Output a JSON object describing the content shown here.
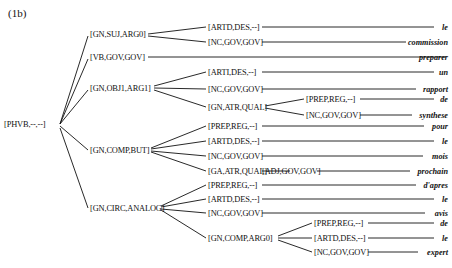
{
  "figure": {
    "caption": "(1b)",
    "sentence_words": [
      "le",
      "commission",
      "preparer",
      "un",
      "rapport",
      "de",
      "synthese",
      "pour",
      "le",
      "mois",
      "prochain",
      "d'apres",
      "le",
      "avis",
      "de",
      "le",
      "expert"
    ]
  },
  "tree": {
    "root": {
      "label": "[PHVB,--,--]",
      "x": 4,
      "y": 124
    },
    "level2": [
      {
        "label": "[GN,SUJ,ARG0]",
        "x": 90,
        "y": 34
      },
      {
        "label": "[VB,GOV,GOV]",
        "x": 90,
        "y": 57
      },
      {
        "label": "[GN,OBJ1,ARG1]",
        "x": 90,
        "y": 88
      },
      {
        "label": "[GN,COMP,BUT]",
        "x": 90,
        "y": 150
      },
      {
        "label": "[GN,CIRC,ANALOG]",
        "x": 90,
        "y": 208
      }
    ],
    "level3": [
      {
        "label": "[ARTD,DES,--]",
        "x": 208,
        "y": 27,
        "parent": 0
      },
      {
        "label": "[NC,GOV,GOV]",
        "x": 208,
        "y": 42,
        "parent": 0
      },
      {
        "label": "[ARTI,DES,--]",
        "x": 208,
        "y": 72,
        "parent": 2
      },
      {
        "label": "[NC,GOV,GOV]",
        "x": 208,
        "y": 89,
        "parent": 2
      },
      {
        "label": "[GN,ATR,QUAL]",
        "x": 208,
        "y": 107,
        "parent": 2
      },
      {
        "label": "[PREP,REG,--]",
        "x": 208,
        "y": 126,
        "parent": 3
      },
      {
        "label": "[ARTD,DES,--]",
        "x": 208,
        "y": 141,
        "parent": 3
      },
      {
        "label": "[NC,GOV,GOV]",
        "x": 208,
        "y": 156,
        "parent": 3
      },
      {
        "label": "[GA,ATR,QUAL]",
        "x": 208,
        "y": 171,
        "parent": 3
      },
      {
        "label": "[PREP,REG,--]",
        "x": 208,
        "y": 185,
        "parent": 4
      },
      {
        "label": "[ARTD,DES,--]",
        "x": 208,
        "y": 199,
        "parent": 4
      },
      {
        "label": "[NC,GOV,GOV]",
        "x": 208,
        "y": 213,
        "parent": 4
      },
      {
        "label": "[GN,COMP,ARG0]",
        "x": 208,
        "y": 238,
        "parent": 4
      }
    ],
    "level4": [
      {
        "label": "[PREP,REG,--]",
        "x": 306,
        "y": 99,
        "parent": 4
      },
      {
        "label": "[NC,GOV,GOV]",
        "x": 306,
        "y": 115,
        "parent": 4
      },
      {
        "label": "[ADJ,GOV,GOV]",
        "x": 262,
        "y": 171,
        "parent": 8
      },
      {
        "label": "[PREP,REG,--]",
        "x": 314,
        "y": 223,
        "parent": 12
      },
      {
        "label": "[ARTD,DES,--]",
        "x": 314,
        "y": 238,
        "parent": 12
      },
      {
        "label": "[NC,GOV,GOV]",
        "x": 314,
        "y": 252,
        "parent": 12
      }
    ],
    "words": [
      {
        "text": "le",
        "right": 448,
        "y": 27
      },
      {
        "text": "commission",
        "right": 448,
        "y": 42
      },
      {
        "text": "preparer",
        "right": 448,
        "y": 57
      },
      {
        "text": "un",
        "right": 448,
        "y": 72
      },
      {
        "text": "rapport",
        "right": 448,
        "y": 89
      },
      {
        "text": "de",
        "right": 448,
        "y": 99
      },
      {
        "text": "synthese",
        "right": 448,
        "y": 115
      },
      {
        "text": "pour",
        "right": 448,
        "y": 126
      },
      {
        "text": "le",
        "right": 448,
        "y": 141
      },
      {
        "text": "mois",
        "right": 448,
        "y": 156
      },
      {
        "text": "prochain",
        "right": 448,
        "y": 171
      },
      {
        "text": "d'apres",
        "right": 448,
        "y": 185
      },
      {
        "text": "le",
        "right": 448,
        "y": 199
      },
      {
        "text": "avis",
        "right": 448,
        "y": 213
      },
      {
        "text": "de",
        "right": 448,
        "y": 223
      },
      {
        "text": "le",
        "right": 448,
        "y": 238
      },
      {
        "text": "expert",
        "right": 448,
        "y": 252
      }
    ],
    "edges": [
      {
        "x1": 60,
        "y1": 124,
        "x2": 88,
        "y2": 36
      },
      {
        "x1": 60,
        "y1": 124,
        "x2": 88,
        "y2": 59
      },
      {
        "x1": 60,
        "y1": 124,
        "x2": 88,
        "y2": 90
      },
      {
        "x1": 60,
        "y1": 126,
        "x2": 88,
        "y2": 150
      },
      {
        "x1": 60,
        "y1": 128,
        "x2": 88,
        "y2": 208
      },
      {
        "x1": 148,
        "y1": 34,
        "x2": 206,
        "y2": 27
      },
      {
        "x1": 148,
        "y1": 36,
        "x2": 206,
        "y2": 42
      },
      {
        "x1": 148,
        "y1": 57,
        "x2": 446,
        "y2": 57
      },
      {
        "x1": 154,
        "y1": 86,
        "x2": 206,
        "y2": 72
      },
      {
        "x1": 154,
        "y1": 88,
        "x2": 206,
        "y2": 89
      },
      {
        "x1": 154,
        "y1": 90,
        "x2": 206,
        "y2": 107
      },
      {
        "x1": 151,
        "y1": 148,
        "x2": 206,
        "y2": 126
      },
      {
        "x1": 151,
        "y1": 149,
        "x2": 206,
        "y2": 141
      },
      {
        "x1": 151,
        "y1": 151,
        "x2": 206,
        "y2": 156
      },
      {
        "x1": 151,
        "y1": 152,
        "x2": 206,
        "y2": 171
      },
      {
        "x1": 161,
        "y1": 206,
        "x2": 206,
        "y2": 185
      },
      {
        "x1": 161,
        "y1": 207,
        "x2": 206,
        "y2": 199
      },
      {
        "x1": 161,
        "y1": 209,
        "x2": 206,
        "y2": 213
      },
      {
        "x1": 161,
        "y1": 210,
        "x2": 206,
        "y2": 238
      },
      {
        "x1": 265,
        "y1": 106,
        "x2": 304,
        "y2": 99
      },
      {
        "x1": 265,
        "y1": 108,
        "x2": 304,
        "y2": 115
      },
      {
        "x1": 262,
        "y1": 171,
        "x2": 290,
        "y2": 171
      },
      {
        "x1": 278,
        "y1": 236,
        "x2": 312,
        "y2": 223
      },
      {
        "x1": 278,
        "y1": 238,
        "x2": 312,
        "y2": 238
      },
      {
        "x1": 278,
        "y1": 240,
        "x2": 312,
        "y2": 252
      },
      {
        "x1": 262,
        "y1": 27,
        "x2": 434,
        "y2": 27
      },
      {
        "x1": 262,
        "y1": 42,
        "x2": 406,
        "y2": 42
      },
      {
        "x1": 262,
        "y1": 72,
        "x2": 434,
        "y2": 72
      },
      {
        "x1": 262,
        "y1": 89,
        "x2": 416,
        "y2": 89
      },
      {
        "x1": 360,
        "y1": 99,
        "x2": 434,
        "y2": 99
      },
      {
        "x1": 360,
        "y1": 115,
        "x2": 412,
        "y2": 115
      },
      {
        "x1": 262,
        "y1": 126,
        "x2": 424,
        "y2": 126
      },
      {
        "x1": 262,
        "y1": 141,
        "x2": 434,
        "y2": 141
      },
      {
        "x1": 262,
        "y1": 156,
        "x2": 423,
        "y2": 156
      },
      {
        "x1": 317,
        "y1": 171,
        "x2": 410,
        "y2": 171
      },
      {
        "x1": 262,
        "y1": 185,
        "x2": 416,
        "y2": 185
      },
      {
        "x1": 262,
        "y1": 199,
        "x2": 434,
        "y2": 199
      },
      {
        "x1": 262,
        "y1": 213,
        "x2": 425,
        "y2": 213
      },
      {
        "x1": 368,
        "y1": 223,
        "x2": 434,
        "y2": 223
      },
      {
        "x1": 368,
        "y1": 238,
        "x2": 434,
        "y2": 238
      },
      {
        "x1": 368,
        "y1": 252,
        "x2": 418,
        "y2": 252
      }
    ]
  }
}
